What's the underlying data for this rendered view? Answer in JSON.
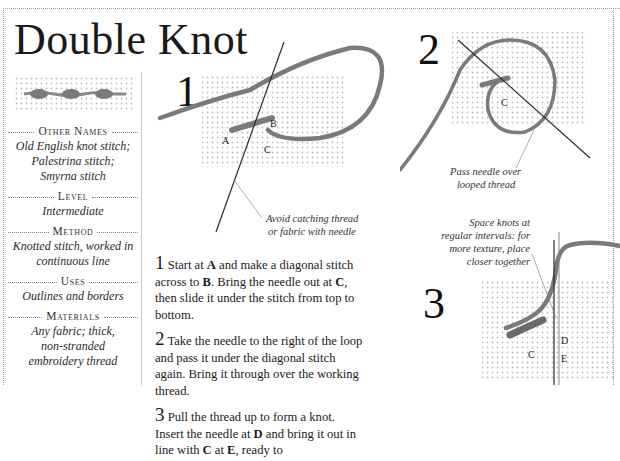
{
  "title": "Double Knot",
  "sidebar": {
    "sections": [
      {
        "heading": "Other Names",
        "lines": [
          "Old English knot stitch;",
          "Palestrina stitch;",
          "Smyrna stitch"
        ]
      },
      {
        "heading": "Level",
        "lines": [
          "Intermediate"
        ]
      },
      {
        "heading": "Method",
        "lines": [
          "Knotted stitch, worked in",
          "continuous line"
        ]
      },
      {
        "heading": "Uses",
        "lines": [
          "Outlines and borders"
        ]
      },
      {
        "heading": "Materials",
        "lines": [
          "Any fabric; thick,",
          "non-stranded",
          "embroidery thread"
        ]
      }
    ]
  },
  "steps": [
    {
      "number": "1",
      "labels": [
        "A",
        "B",
        "C"
      ],
      "callout": [
        "Avoid catching thread",
        "or fabric with needle"
      ]
    },
    {
      "number": "2",
      "labels": [
        "C"
      ],
      "callout": [
        "Pass needle over",
        "looped thread"
      ]
    },
    {
      "number": "3",
      "labels": [
        "C",
        "D",
        "E"
      ],
      "callout": [
        "Space knots at",
        "regular intervals: for",
        "more texture, place",
        "closer together"
      ]
    }
  ],
  "instructions": [
    {
      "num": "1",
      "parts": [
        " Start at ",
        "A",
        " and make a diagonal stitch across to ",
        "B",
        ". Bring the needle out at ",
        "C",
        ", then slide it under the stitch from top to bottom."
      ]
    },
    {
      "num": "2",
      "text": " Take the needle to the right of the loop and pass it under the diagonal stitch again. Bring it through over the working thread."
    },
    {
      "num": "3",
      "parts": [
        " Pull the thread up to form a knot. Insert the needle at ",
        "D",
        " and bring it out in line with ",
        "C",
        " at ",
        "E",
        ", ready to"
      ]
    }
  ],
  "colors": {
    "thread": "#7a7a7a",
    "canvas_dot": "#bdbdbd",
    "needle": "#2a2a2a",
    "text": "#1a1a1a"
  }
}
